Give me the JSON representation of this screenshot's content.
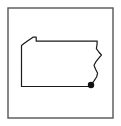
{
  "figure": {
    "type": "map",
    "title": "",
    "background_color": "#ffffff",
    "frame": {
      "name": "map-border-frame",
      "stroke_color": "#555555",
      "stroke_width": 1.4,
      "fill": "none",
      "x": 8,
      "y": 8,
      "width": 105,
      "height": 110
    },
    "state_outline": {
      "name": "pennsylvania-outline",
      "stroke_color": "#1a1a1a",
      "stroke_width": 1.2,
      "fill": "#ffffff",
      "path": "M 21.5,45.5 L 21.5,86.5 L 90.5,86.5 L 91.8,84.0 L 94.0,80.5 L 96.5,77.0 L 97.6,73.0 L 95.6,69.0 L 94.0,65.0 L 96.0,61.5 L 98.6,58.0 L 101.5,55.0 L 98.8,52.0 L 96.5,48.5 L 97.0,44.5 L 97.2,41.2 L 36.2,41.2 L 36.2,37.2 L 33.0,37.2 L 27.5,41.0 L 24.0,43.6 Z"
    },
    "city_marker": {
      "name": "city-marker-dot",
      "fill_color": "#111111",
      "radius": 3.2,
      "cx": 91,
      "cy": 85,
      "label": ""
    }
  }
}
